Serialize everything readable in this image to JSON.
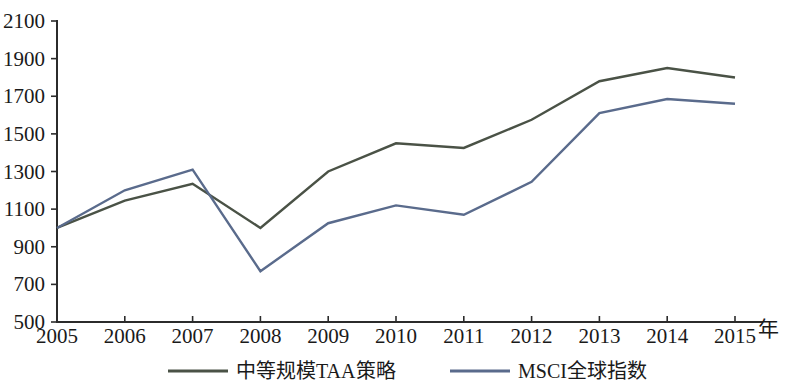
{
  "chart_data": {
    "type": "line",
    "title": "",
    "xlabel": "年",
    "ylabel": "",
    "x": [
      2005,
      2006,
      2007,
      2008,
      2009,
      2010,
      2011,
      2012,
      2013,
      2014,
      2015
    ],
    "categories": [
      "2005",
      "2006",
      "2007",
      "2008",
      "2009",
      "2010",
      "2011",
      "2012",
      "2013",
      "2014",
      "2015"
    ],
    "xlim": [
      2005,
      2015
    ],
    "ylim": [
      500,
      2100
    ],
    "yticks": [
      500,
      700,
      900,
      1100,
      1300,
      1500,
      1700,
      1900,
      2100
    ],
    "ytick_labels": [
      "500",
      "700",
      "900",
      "1100",
      "1300",
      "1500",
      "1700",
      "1900",
      "2100"
    ],
    "grid": false,
    "legend_position": "bottom",
    "series": [
      {
        "name": "中等规模TAA策略",
        "color": "#4a5246",
        "values": [
          1000,
          1145,
          1235,
          1000,
          1300,
          1450,
          1425,
          1575,
          1780,
          1850,
          1800
        ]
      },
      {
        "name": "MSCI全球指数",
        "color": "#5a6b8c",
        "values": [
          1000,
          1200,
          1310,
          770,
          1025,
          1120,
          1070,
          1245,
          1610,
          1685,
          1660
        ]
      }
    ]
  },
  "axis": {
    "x_unit_label": "年"
  },
  "legend": {
    "items": [
      {
        "label": "中等规模TAA策略",
        "color": "#4a5246"
      },
      {
        "label": "MSCI全球指数",
        "color": "#5a6b8c"
      }
    ]
  }
}
